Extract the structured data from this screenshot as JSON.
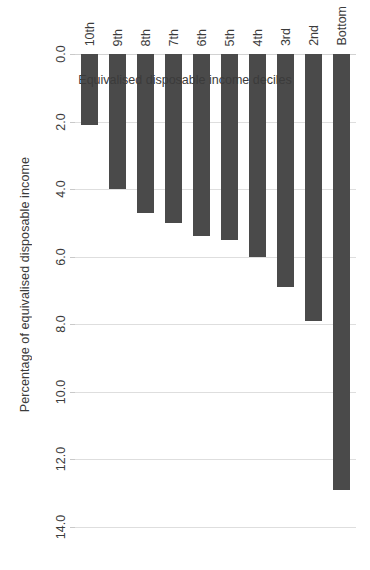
{
  "chart_data": {
    "type": "bar",
    "orientation": "horizontal",
    "title": "",
    "xlabel": "Percentage of equivalised disposable income",
    "ylabel": "Equivalised disposable income deciles",
    "categories": [
      "Bottom",
      "2nd",
      "3rd",
      "4th",
      "5th",
      "6th",
      "7th",
      "8th",
      "9th",
      "10th"
    ],
    "values": [
      12.9,
      7.9,
      6.9,
      6.0,
      5.5,
      5.4,
      5.0,
      4.7,
      4.0,
      2.1
    ],
    "value_axis": {
      "min": 0.0,
      "max": 14.0,
      "step": 2.0,
      "ticks": [
        "0.0",
        "2.0",
        "4.0",
        "6.0",
        "8.0",
        "10.0",
        "12.0",
        "14.0"
      ],
      "tick_values": [
        0.0,
        2.0,
        4.0,
        6.0,
        8.0,
        10.0,
        12.0,
        14.0
      ]
    },
    "grid": true,
    "legend": "none",
    "bar_color": "#4a4a4a",
    "gridline_color": "#dedede",
    "background": "#ffffff",
    "rotation_note": "figure rendered rotated 90 degrees; tick and category text appear upside-down"
  }
}
